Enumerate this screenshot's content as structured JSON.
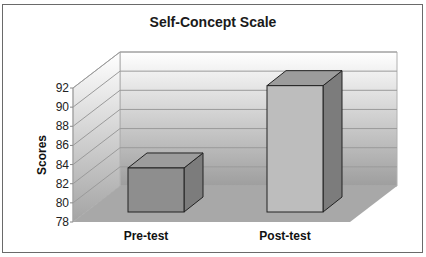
{
  "chart_data": {
    "type": "bar",
    "style": "3d-column",
    "title": "Self-Concept Scale",
    "xlabel": "",
    "ylabel": "Scores",
    "categories": [
      "Pre-test",
      "Post-test"
    ],
    "values": [
      82.6,
      91.2
    ],
    "ylim": [
      78,
      92
    ],
    "yticks": [
      78,
      80,
      82,
      84,
      86,
      88,
      90,
      92
    ],
    "grid": true,
    "legend": null,
    "colors": {
      "bar_front": [
        "#8e8e8e",
        "#bdbdbd"
      ],
      "bar_side": "#7c7c7c",
      "bar_top": "#9c9c9c",
      "floor": "#a8a8a8",
      "wall_top": "#ffffff",
      "wall_bottom": "#a0a0a0",
      "gridline": "#9a9a9a"
    }
  }
}
